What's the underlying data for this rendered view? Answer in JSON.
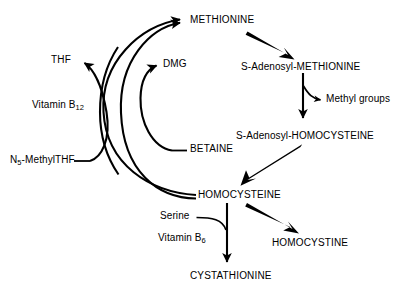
{
  "diagram": {
    "background_color": "#ffffff",
    "stroke_color": "#000000",
    "width": 410,
    "height": 293,
    "nodes": {
      "methionine": "METHIONINE",
      "sam": "S-Adenosyl-METHIONINE",
      "methyl_groups": "Methyl groups",
      "sah": "S-Adenosyl-HOMOCYSTEINE",
      "homocysteine": "HOMOCYSTEINE",
      "homocystine": "HOMOCYSTINE",
      "cystathionine": "CYSTATHIONINE",
      "thf": "THF",
      "n5_methylthf_prefix": "N",
      "n5_methylthf_sub": "5",
      "n5_methylthf_suffix": "-MethylTHF",
      "vitamin_b12_prefix": "Vitamin B",
      "vitamin_b12_sub": "12",
      "dmg": "DMG",
      "betaine": "BETAINE",
      "serine": "Serine",
      "vitamin_b6_prefix": "Vitamin B",
      "vitamin_b6_sub": "6"
    },
    "edges": [
      {
        "from": "METHIONINE",
        "to": "S-Adenosyl-METHIONINE",
        "style": "thick-straight"
      },
      {
        "from": "S-Adenosyl-METHIONINE",
        "to": "S-Adenosyl-HOMOCYSTEINE",
        "style": "thin-vertical"
      },
      {
        "from": "S-Adenosyl-METHIONINE",
        "to": "Methyl groups",
        "style": "thin-curved-branch"
      },
      {
        "from": "S-Adenosyl-HOMOCYSTEINE",
        "to": "HOMOCYSTEINE",
        "style": "thick-straight"
      },
      {
        "from": "HOMOCYSTEINE",
        "to": "HOMOCYSTINE",
        "style": "thick-straight"
      },
      {
        "from": "HOMOCYSTEINE",
        "to": "CYSTATHIONINE",
        "style": "thin-vertical"
      },
      {
        "from": "Serine",
        "to": "CYSTATHIONINE",
        "style": "thin-curved-branch"
      },
      {
        "from": "HOMOCYSTEINE",
        "to": "METHIONINE",
        "style": "thin-arc-outer"
      },
      {
        "from": "HOMOCYSTEINE",
        "to": "METHIONINE",
        "style": "thin-arc-inner"
      },
      {
        "from": "N5-MethylTHF",
        "to": "THF",
        "style": "thin-crossing-arc"
      },
      {
        "from": "BETAINE",
        "to": "DMG",
        "style": "thin-curved-arc"
      }
    ],
    "cofactors": [
      "Vitamin B12",
      "Vitamin B6",
      "Serine",
      "BETAINE",
      "N5-MethylTHF"
    ],
    "products": [
      "THF",
      "DMG",
      "Methyl groups",
      "HOMOCYSTINE",
      "CYSTATHIONINE"
    ]
  }
}
